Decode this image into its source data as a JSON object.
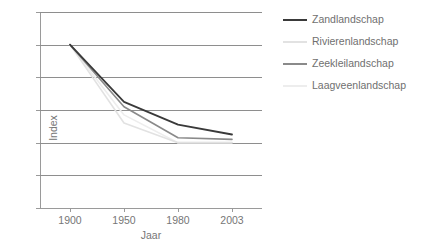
{
  "figure": {
    "background": "#ffffff",
    "axis_color": "#9a9a9a",
    "grid_color": "#8e8e8e",
    "text_color": "#6f6f6f"
  },
  "axes": {
    "ylabel": "Index",
    "xlabel": "Jaar",
    "yticks": [
      "0",
      "20",
      "40",
      "60",
      "80",
      "100",
      "120"
    ],
    "xticks": [
      "1900",
      "1950",
      "1980",
      "2003"
    ]
  },
  "legend": {
    "position": "right",
    "items": [
      {
        "label": "Zandlandschap",
        "color": "#3a3a3a",
        "has_swatch": true
      },
      {
        "label": "Rivierenlandschap",
        "color": "#e2e2e2",
        "has_swatch": true
      },
      {
        "label": "Zeekleilandschap",
        "color": "#8a8a8a",
        "has_swatch": true
      },
      {
        "label": "Laagveenlandschap",
        "color": "#ededed",
        "has_swatch": true
      }
    ]
  },
  "chart_data": {
    "type": "line",
    "title": "",
    "xlabel": "Jaar",
    "ylabel": "Index",
    "categories": [
      "1900",
      "1950",
      "1980",
      "2003"
    ],
    "ylim": [
      0,
      120
    ],
    "ytick_step": 20,
    "grid": true,
    "legend_position": "right",
    "series": [
      {
        "name": "Zandlandschap",
        "color": "#3a3a3a",
        "width": 1.8,
        "values": [
          100,
          65,
          51,
          45
        ]
      },
      {
        "name": "Rivierenlandschap",
        "color": "#e2e2e2",
        "width": 1.6,
        "values": [
          100,
          52,
          40,
          40
        ]
      },
      {
        "name": "Zeekleilandschap",
        "color": "#8a8a8a",
        "width": 1.6,
        "values": [
          100,
          62,
          43,
          42
        ]
      },
      {
        "name": "Laagveenlandschap",
        "color": "#ededed",
        "width": 1.6,
        "values": [
          100,
          57,
          40,
          40
        ]
      }
    ]
  }
}
